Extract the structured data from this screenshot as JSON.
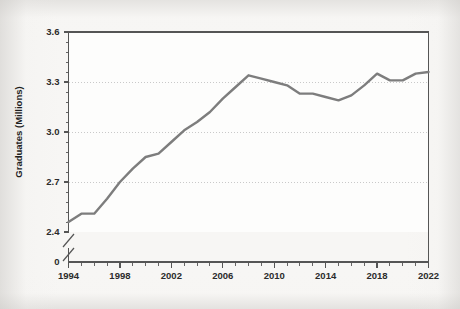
{
  "chart_data": {
    "type": "line",
    "title": "",
    "subtitle": "",
    "xlabel": "",
    "ylabel": "Graduates (Millions)",
    "x": [
      1994,
      1995,
      1996,
      1997,
      1998,
      1999,
      2000,
      2001,
      2002,
      2003,
      2004,
      2005,
      2006,
      2007,
      2008,
      2009,
      2010,
      2011,
      2012,
      2013,
      2014,
      2015,
      2016,
      2017,
      2018,
      2019,
      2020,
      2021,
      2022
    ],
    "values": [
      2.46,
      2.51,
      2.51,
      2.6,
      2.7,
      2.78,
      2.85,
      2.87,
      2.94,
      3.01,
      3.06,
      3.12,
      3.2,
      3.27,
      3.34,
      3.32,
      3.3,
      3.28,
      3.23,
      3.23,
      3.21,
      3.19,
      3.22,
      3.28,
      3.35,
      3.31,
      3.31,
      3.35,
      3.36
    ],
    "series": [
      {
        "name": "Graduates",
        "color": "#7d7d7d",
        "values": [
          2.46,
          2.51,
          2.51,
          2.6,
          2.7,
          2.78,
          2.85,
          2.87,
          2.94,
          3.01,
          3.06,
          3.12,
          3.2,
          3.27,
          3.34,
          3.32,
          3.3,
          3.28,
          3.23,
          3.23,
          3.21,
          3.19,
          3.22,
          3.28,
          3.35,
          3.31,
          3.31,
          3.35,
          3.36
        ]
      }
    ],
    "ylim": [
      2.4,
      3.6
    ],
    "xlim": [
      1994,
      2022
    ],
    "y_ticks": [
      2.4,
      2.7,
      3.0,
      3.3,
      3.6
    ],
    "y_tick_labels": [
      "2.4",
      "2.7",
      "3.0",
      "3.3",
      "3.6"
    ],
    "y_zero_label": "0",
    "y_axis_break": true,
    "x_ticks": [
      1994,
      1998,
      2002,
      2006,
      2010,
      2014,
      2018,
      2022
    ],
    "x_tick_labels": [
      "1994",
      "1998",
      "2002",
      "2006",
      "2010",
      "2014",
      "2018",
      "2022"
    ],
    "x_minor_tick_interval": 1,
    "grid": true,
    "grid_style": "dotted-horizontal",
    "legend": false,
    "legend_position": "none",
    "annotations": []
  },
  "axis": {
    "y_title": "Graduates (Millions)",
    "y_labels": [
      "3.6",
      "3.3",
      "3.0",
      "2.7",
      "2.4",
      "0"
    ],
    "x_labels": [
      "1994",
      "1998",
      "2002",
      "2006",
      "2010",
      "2014",
      "2018",
      "2022"
    ]
  },
  "colors": {
    "line": "#7d7d7d",
    "axis": "#555555",
    "grid": "#c9c9c9",
    "plot_background": "#fdfdfc",
    "page_background": "#f7f6f4",
    "text": "#2b2b2b"
  }
}
